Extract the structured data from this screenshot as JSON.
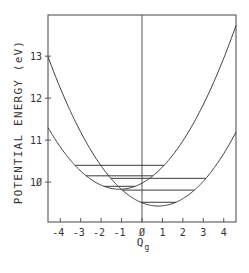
{
  "chart_data": {
    "type": "line",
    "title": "",
    "xlabel": "Q",
    "xlabel_subscript": "g",
    "ylabel": "POTENTIAL ENERGY (eV)",
    "xlim": [
      -4.6,
      4.6
    ],
    "ylim": [
      9.05,
      13.98
    ],
    "x_ticks": [
      -4,
      -3,
      -2,
      -1,
      0,
      1,
      2,
      3,
      4
    ],
    "x_tick_labels": [
      "-4",
      "-3",
      "-2",
      "-1",
      "Ø",
      "1",
      "2",
      "3",
      "4"
    ],
    "y_ticks": [
      10,
      11,
      12,
      13
    ],
    "y_tick_labels": [
      "1Ø",
      "11",
      "12",
      "13"
    ],
    "grid": false,
    "vertical_line_at_x": 0,
    "series": [
      {
        "name": "left-parabola",
        "form": "E = E0 + k (Q - Q0)^2",
        "Q0": -1.1,
        "E0": 9.83,
        "k": 0.12,
        "levels": [
          10.4,
          10.15,
          9.9
        ]
      },
      {
        "name": "right-parabola",
        "form": "E = E0 + k (Q - Q0)^2",
        "Q0": 0.8,
        "E0": 9.43,
        "k": 0.122,
        "levels": [
          10.09,
          9.81,
          9.52
        ]
      }
    ],
    "colors": {
      "line": "#3a3a3a",
      "axis": "#555555",
      "text": "#333333"
    }
  }
}
